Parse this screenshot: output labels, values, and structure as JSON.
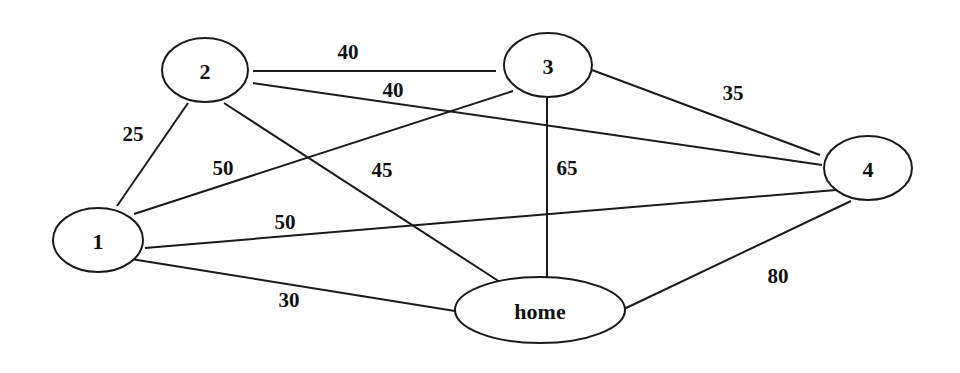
{
  "diagram": {
    "type": "weighted-undirected-graph",
    "colors": {
      "stroke": "#1a1a1a",
      "text": "#111111",
      "background": "#ffffff"
    },
    "nodes": [
      {
        "id": "2",
        "label": "2",
        "cx": 205,
        "cy": 70,
        "rx": 43,
        "ry": 32
      },
      {
        "id": "3",
        "label": "3",
        "cx": 548,
        "cy": 65,
        "rx": 44,
        "ry": 32
      },
      {
        "id": "4",
        "label": "4",
        "cx": 868,
        "cy": 168,
        "rx": 44,
        "ry": 32
      },
      {
        "id": "1",
        "label": "1",
        "cx": 98,
        "cy": 240,
        "rx": 45,
        "ry": 32
      },
      {
        "id": "home",
        "label": "home",
        "cx": 540,
        "cy": 310,
        "rx": 85,
        "ry": 33
      }
    ],
    "edges": [
      {
        "from": "2",
        "to": "3",
        "weight": "40",
        "x1": 253,
        "y1": 71,
        "x2": 496,
        "y2": 71,
        "lx": 348,
        "ly": 52
      },
      {
        "from": "2",
        "to": "4",
        "weight": "40",
        "x1": 253,
        "y1": 83,
        "x2": 822,
        "y2": 165,
        "lx": 393,
        "ly": 90
      },
      {
        "from": "2",
        "to": "1",
        "weight": "25",
        "x1": 188,
        "y1": 103,
        "x2": 117,
        "y2": 206,
        "lx": 133,
        "ly": 134
      },
      {
        "from": "2",
        "to": "home",
        "weight": "45",
        "x1": 224,
        "y1": 103,
        "x2": 500,
        "y2": 282,
        "lx": 382,
        "ly": 170
      },
      {
        "from": "3",
        "to": "1",
        "weight": "50",
        "x1": 513,
        "y1": 91,
        "x2": 134,
        "y2": 214,
        "lx": 223,
        "ly": 168
      },
      {
        "from": "3",
        "to": "4",
        "weight": "35",
        "x1": 592,
        "y1": 70,
        "x2": 820,
        "y2": 155,
        "lx": 733,
        "ly": 93
      },
      {
        "from": "3",
        "to": "home",
        "weight": "65",
        "x1": 547,
        "y1": 98,
        "x2": 547,
        "y2": 277,
        "lx": 567,
        "ly": 168
      },
      {
        "from": "1",
        "to": "4",
        "weight": "50",
        "x1": 145,
        "y1": 248,
        "x2": 836,
        "y2": 190,
        "lx": 285,
        "ly": 222
      },
      {
        "from": "1",
        "to": "home",
        "weight": "30",
        "x1": 131,
        "y1": 259,
        "x2": 455,
        "y2": 311,
        "lx": 289,
        "ly": 300
      },
      {
        "from": "home",
        "to": "4",
        "weight": "80",
        "x1": 624,
        "y1": 309,
        "x2": 851,
        "y2": 201,
        "lx": 778,
        "ly": 276
      }
    ]
  }
}
